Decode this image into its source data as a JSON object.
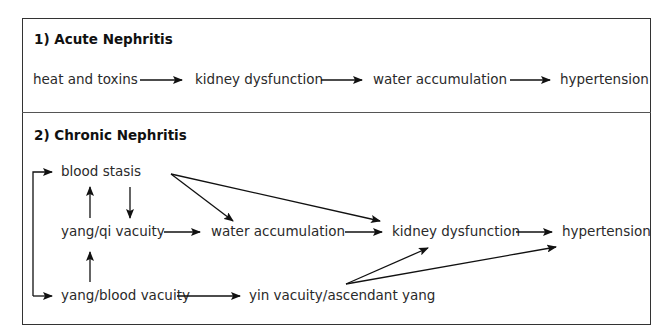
{
  "sections": [
    {
      "heading": "1) Acute Nephritis",
      "nodes": {
        "heat_toxins": "heat and toxins",
        "kidney_dysfunction": "kidney dysfunction",
        "water_accumulation": "water accumulation",
        "hypertension": "hypertension"
      },
      "edges": [
        [
          "heat and toxins",
          "kidney dysfunction"
        ],
        [
          "kidney dysfunction",
          "water accumulation"
        ],
        [
          "water accumulation",
          "hypertension"
        ]
      ]
    },
    {
      "heading": "2) Chronic Nephritis",
      "nodes": {
        "blood_stasis": "blood stasis",
        "yang_qi_vacuity": "yang/qi vacuity",
        "water_accumulation": "water accumulation",
        "kidney_dysfunction": "kidney dysfunction",
        "hypertension": "hypertension",
        "yang_blood_vacuity": "yang/blood vacuity",
        "yin_vacuity": "yin vacuity/ascendant yang"
      },
      "edges": [
        [
          "yang/qi vacuity",
          "blood stasis"
        ],
        [
          "blood stasis",
          "yang/qi vacuity"
        ],
        [
          "yang/blood vacuity",
          "yang/qi vacuity"
        ],
        [
          "yang/blood vacuity",
          "blood stasis"
        ],
        [
          "yang/qi vacuity",
          "water accumulation"
        ],
        [
          "blood stasis",
          "water accumulation"
        ],
        [
          "blood stasis",
          "kidney dysfunction"
        ],
        [
          "water accumulation",
          "kidney dysfunction"
        ],
        [
          "kidney dysfunction",
          "hypertension"
        ],
        [
          "yang/blood vacuity",
          "yin vacuity/ascendant yang"
        ],
        [
          "yin vacuity/ascendant yang",
          "kidney dysfunction"
        ],
        [
          "yin vacuity/ascendant yang",
          "hypertension"
        ]
      ]
    }
  ]
}
